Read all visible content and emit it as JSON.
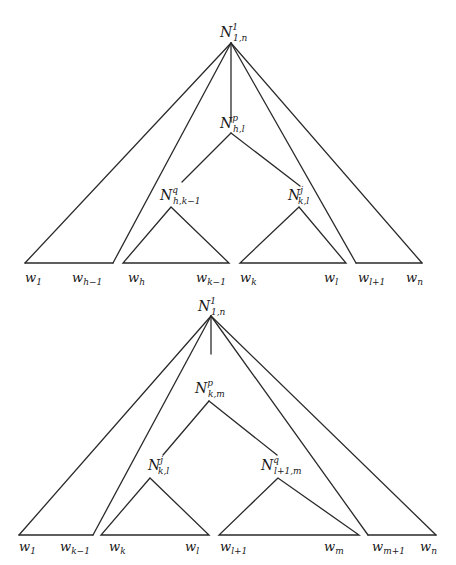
{
  "diagrams": [
    {
      "id": "tree-top",
      "root": {
        "base": "N",
        "sup": "1",
        "sub": "1,n"
      },
      "middle": {
        "base": "N",
        "sup": "p",
        "sub": "h,l"
      },
      "left_child": {
        "base": "N",
        "sup": "q",
        "sub": "h,k−1"
      },
      "right_child": {
        "base": "N",
        "sup": "j",
        "sub": "k,l"
      },
      "leaves": [
        {
          "base": "w",
          "sub": "1"
        },
        {
          "base": "w",
          "sub": "h−1"
        },
        {
          "base": "w",
          "sub": "h"
        },
        {
          "base": "w",
          "sub": "k−1"
        },
        {
          "base": "w",
          "sub": "k"
        },
        {
          "base": "w",
          "sub": "l"
        },
        {
          "base": "w",
          "sub": "l+1"
        },
        {
          "base": "w",
          "sub": "n"
        }
      ]
    },
    {
      "id": "tree-bottom",
      "root": {
        "base": "N",
        "sup": "1",
        "sub": "1,n"
      },
      "middle": {
        "base": "N",
        "sup": "p",
        "sub": "k,m"
      },
      "left_child": {
        "base": "N",
        "sup": "j",
        "sub": "k,l"
      },
      "right_child": {
        "base": "N",
        "sup": "q",
        "sub": "l+1,m"
      },
      "leaves": [
        {
          "base": "w",
          "sub": "1"
        },
        {
          "base": "w",
          "sub": "k−1"
        },
        {
          "base": "w",
          "sub": "k"
        },
        {
          "base": "w",
          "sub": "l"
        },
        {
          "base": "w",
          "sub": "l+1"
        },
        {
          "base": "w",
          "sub": "m"
        },
        {
          "base": "w",
          "sub": "m+1"
        },
        {
          "base": "w",
          "sub": "n"
        }
      ]
    }
  ],
  "colors": {
    "line": "#2a2a2a",
    "text": "#1a1a1a",
    "background": "#ffffff"
  }
}
